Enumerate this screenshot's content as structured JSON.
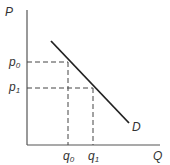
{
  "diagram": {
    "type": "demand-curve",
    "axes": {
      "y_label": "P",
      "x_label": "Q"
    },
    "price_levels": [
      {
        "label": "p",
        "sub": "0"
      },
      {
        "label": "p",
        "sub": "1"
      }
    ],
    "quantity_levels": [
      {
        "label": "q",
        "sub": "0"
      },
      {
        "label": "q",
        "sub": "1"
      }
    ],
    "curve_label": "D",
    "colors": {
      "line": "#222222",
      "text": "#333333",
      "axis": "#555555"
    }
  }
}
